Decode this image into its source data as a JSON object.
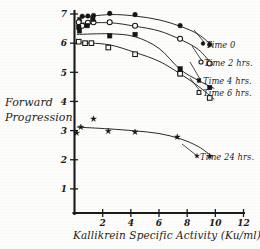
{
  "chart_data": {
    "type": "scatter",
    "title": "",
    "xlabel": "Kallikrein Specific Activity (Ku/ml)",
    "ylabel_line1": "Forward",
    "ylabel_line2": "Progression",
    "ylabel": "Forward Progression",
    "xlim": [
      0,
      12
    ],
    "ylim": [
      0,
      7.35
    ],
    "xticks": [
      2,
      4,
      6,
      8,
      10,
      12
    ],
    "yticks": [
      1,
      2,
      3,
      4,
      5,
      6,
      7
    ],
    "xtick_labels": [
      "2",
      "4",
      "6",
      "8",
      "10",
      "12"
    ],
    "ytick_labels": [
      "1",
      "2",
      "3",
      "4",
      "5",
      "6",
      "7"
    ],
    "grid": false,
    "legend_position": "right",
    "series": [
      {
        "name": "Time 0",
        "marker": "filled-circle",
        "color": "#141414",
        "points": [
          {
            "x": 0.35,
            "y": 6.78
          },
          {
            "x": 0.55,
            "y": 6.92
          },
          {
            "x": 0.95,
            "y": 6.93
          },
          {
            "x": 1.35,
            "y": 6.95
          },
          {
            "x": 2.5,
            "y": 7.02
          },
          {
            "x": 4.3,
            "y": 6.98
          },
          {
            "x": 7.5,
            "y": 6.6
          },
          {
            "x": 9.6,
            "y": 5.95
          }
        ],
        "curve": [
          {
            "x": 0.2,
            "y": 6.87
          },
          {
            "x": 2.5,
            "y": 6.98
          },
          {
            "x": 4.3,
            "y": 6.93
          },
          {
            "x": 6.0,
            "y": 6.8
          },
          {
            "x": 7.5,
            "y": 6.58
          },
          {
            "x": 8.8,
            "y": 6.3
          },
          {
            "x": 9.8,
            "y": 5.9
          }
        ]
      },
      {
        "name": "Time 2 hrs.",
        "marker": "open-circle",
        "color": "#141414",
        "points": [
          {
            "x": 0.3,
            "y": 6.72
          },
          {
            "x": 0.55,
            "y": 6.6
          },
          {
            "x": 0.95,
            "y": 6.7
          },
          {
            "x": 1.35,
            "y": 6.72
          },
          {
            "x": 2.5,
            "y": 6.72
          },
          {
            "x": 4.3,
            "y": 6.6
          },
          {
            "x": 7.5,
            "y": 6.15
          },
          {
            "x": 9.6,
            "y": 5.3
          }
        ],
        "curve": [
          {
            "x": 0.2,
            "y": 6.68
          },
          {
            "x": 2.5,
            "y": 6.7
          },
          {
            "x": 4.3,
            "y": 6.58
          },
          {
            "x": 6.0,
            "y": 6.42
          },
          {
            "x": 7.5,
            "y": 6.13
          },
          {
            "x": 8.8,
            "y": 5.78
          },
          {
            "x": 9.8,
            "y": 5.25
          }
        ]
      },
      {
        "name": "Time 4 hrs.",
        "marker": "filled-square",
        "color": "#141414",
        "points": [
          {
            "x": 0.3,
            "y": 6.55
          },
          {
            "x": 0.35,
            "y": 6.42
          },
          {
            "x": 0.9,
            "y": 6.6
          },
          {
            "x": 1.3,
            "y": 6.82
          },
          {
            "x": 2.5,
            "y": 6.25
          },
          {
            "x": 4.3,
            "y": 6.3
          },
          {
            "x": 7.5,
            "y": 5.12
          },
          {
            "x": 7.5,
            "y": 4.95
          },
          {
            "x": 9.6,
            "y": 4.48
          }
        ],
        "curve": [
          {
            "x": 0.2,
            "y": 6.3
          },
          {
            "x": 2.5,
            "y": 6.32
          },
          {
            "x": 4.3,
            "y": 6.22
          },
          {
            "x": 6.0,
            "y": 5.82
          },
          {
            "x": 7.5,
            "y": 5.1
          },
          {
            "x": 8.8,
            "y": 4.72
          },
          {
            "x": 9.9,
            "y": 4.45
          }
        ]
      },
      {
        "name": "Time 6 hrs.",
        "marker": "open-square",
        "color": "#141414",
        "points": [
          {
            "x": 0.3,
            "y": 6.05
          },
          {
            "x": 0.75,
            "y": 6.0
          },
          {
            "x": 1.2,
            "y": 6.0
          },
          {
            "x": 2.4,
            "y": 5.85
          },
          {
            "x": 4.3,
            "y": 5.62
          },
          {
            "x": 7.5,
            "y": 4.95
          },
          {
            "x": 9.6,
            "y": 4.12
          }
        ],
        "curve": [
          {
            "x": 0.2,
            "y": 6.02
          },
          {
            "x": 2.4,
            "y": 5.95
          },
          {
            "x": 4.3,
            "y": 5.68
          },
          {
            "x": 6.0,
            "y": 5.38
          },
          {
            "x": 7.5,
            "y": 4.95
          },
          {
            "x": 8.8,
            "y": 4.52
          },
          {
            "x": 9.9,
            "y": 4.08
          }
        ]
      },
      {
        "name": "Time 24 hrs.",
        "marker": "star",
        "color": "#141414",
        "points": [
          {
            "x": 0.15,
            "y": 2.92
          },
          {
            "x": 0.45,
            "y": 3.12
          },
          {
            "x": 1.35,
            "y": 3.4
          },
          {
            "x": 2.4,
            "y": 2.98
          },
          {
            "x": 4.3,
            "y": 2.95
          },
          {
            "x": 7.3,
            "y": 2.78
          },
          {
            "x": 9.6,
            "y": 2.12
          }
        ],
        "curve": [
          {
            "x": 0.2,
            "y": 3.12
          },
          {
            "x": 2.4,
            "y": 3.06
          },
          {
            "x": 4.3,
            "y": 2.99
          },
          {
            "x": 6.0,
            "y": 2.9
          },
          {
            "x": 7.5,
            "y": 2.72
          },
          {
            "x": 8.8,
            "y": 2.45
          },
          {
            "x": 9.8,
            "y": 2.1
          }
        ]
      }
    ]
  },
  "legend": {
    "entries": [
      {
        "id": "time-0",
        "label": "Time 0",
        "marker": "filled-circle"
      },
      {
        "id": "time-2",
        "label": "Time 2 hrs.",
        "marker": "open-circle"
      },
      {
        "id": "time-4",
        "label": "Time 4 hrs.",
        "marker": "filled-square"
      },
      {
        "id": "time-6",
        "label": "Time 6 hrs.",
        "marker": "open-square"
      },
      {
        "id": "time-24",
        "label": "Time 24 hrs.",
        "marker": "star"
      }
    ]
  }
}
